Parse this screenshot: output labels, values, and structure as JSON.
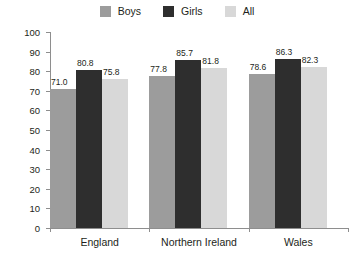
{
  "legend": {
    "position": "top-center",
    "items": [
      {
        "label": "Boys",
        "color": "#9c9c9c",
        "swatch_name": "legend-swatch-boys"
      },
      {
        "label": "Girls",
        "color": "#2e2e2e",
        "swatch_name": "legend-swatch-girls"
      },
      {
        "label": "All",
        "color": "#d8d8d8",
        "swatch_name": "legend-swatch-all"
      }
    ]
  },
  "axis": {
    "y_ticks": [
      "0",
      "10",
      "20",
      "30",
      "40",
      "50",
      "60",
      "70",
      "80",
      "90",
      "100"
    ],
    "x_categories": [
      "England",
      "Northern Ireland",
      "Wales"
    ]
  },
  "chart_data": {
    "type": "bar",
    "title": "",
    "subtitle": "",
    "xlabel": "",
    "ylabel": "",
    "ylim": [
      0,
      100
    ],
    "ytick_step": 10,
    "grid": false,
    "legend_position": "top-center",
    "categories": [
      "England",
      "Northern Ireland",
      "Wales"
    ],
    "series": [
      {
        "name": "Boys",
        "color": "#9c9c9c",
        "values": [
          71.0,
          77.8,
          78.6
        ],
        "labels": [
          "71.0",
          "77.8",
          "78.6"
        ]
      },
      {
        "name": "Girls",
        "color": "#2e2e2e",
        "values": [
          80.8,
          85.7,
          86.3
        ],
        "labels": [
          "80.8",
          "85.7",
          "86.3"
        ]
      },
      {
        "name": "All",
        "color": "#d8d8d8",
        "values": [
          75.8,
          81.8,
          82.3
        ],
        "labels": [
          "75.8",
          "81.8",
          "82.3"
        ]
      }
    ]
  }
}
